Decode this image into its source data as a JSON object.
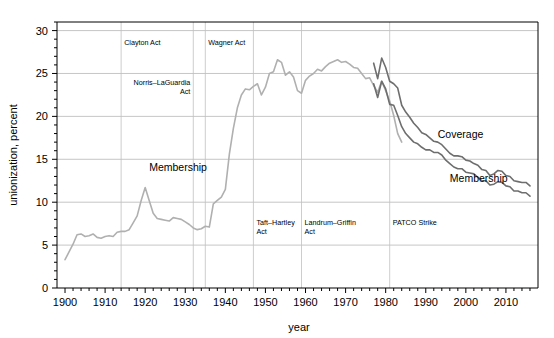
{
  "chart_data": {
    "type": "line",
    "title": "",
    "xlabel": "year",
    "ylabel": "unionization, percent",
    "xlim": [
      1898,
      2018
    ],
    "ylim": [
      0,
      31
    ],
    "x_ticks": [
      1900,
      1910,
      1920,
      1930,
      1940,
      1950,
      1960,
      1970,
      1980,
      1990,
      2000,
      2010
    ],
    "x_tick_labels": [
      "1900",
      "1910",
      "1920",
      "1930",
      "1940",
      "1950",
      "1960",
      "1970",
      "1980",
      "1990",
      "2000",
      "2010"
    ],
    "x_minor_step": 2,
    "y_ticks": [
      0,
      5,
      10,
      15,
      20,
      25,
      30
    ],
    "y_tick_labels": [
      "0",
      "5",
      "10",
      "15",
      "20",
      "25",
      "30"
    ],
    "y_minor_step": 1,
    "grid": "horizontal-major-and-event-verticals",
    "legend_position": "inline-labels",
    "series": [
      {
        "name": "Membership (historical)",
        "color": "#b0b0b0",
        "label_text": "Membership",
        "label_x": 1921,
        "label_y": 13.6,
        "x": [
          1900,
          1901,
          1902,
          1903,
          1904,
          1905,
          1906,
          1907,
          1908,
          1909,
          1910,
          1911,
          1912,
          1913,
          1914,
          1915,
          1916,
          1917,
          1918,
          1919,
          1920,
          1921,
          1922,
          1923,
          1924,
          1925,
          1926,
          1927,
          1928,
          1929,
          1930,
          1931,
          1932,
          1933,
          1934,
          1935,
          1936,
          1937,
          1938,
          1939,
          1940,
          1941,
          1942,
          1943,
          1944,
          1945,
          1946,
          1947,
          1948,
          1949,
          1950,
          1951,
          1952,
          1953,
          1954,
          1955,
          1956,
          1957,
          1958,
          1959,
          1960,
          1961,
          1962,
          1963,
          1964,
          1965,
          1966,
          1967,
          1968,
          1969,
          1970,
          1971,
          1972,
          1973,
          1974,
          1975,
          1976,
          1977,
          1978,
          1979,
          1980,
          1981,
          1982,
          1983,
          1984
        ],
        "y": [
          3.3,
          4.2,
          5.1,
          6.2,
          6.3,
          6.0,
          6.1,
          6.3,
          5.9,
          5.8,
          6.0,
          6.1,
          6.0,
          6.5,
          6.6,
          6.6,
          6.8,
          7.6,
          8.4,
          10.2,
          11.7,
          10.2,
          8.7,
          8.1,
          8.0,
          7.9,
          7.8,
          8.2,
          8.1,
          8.0,
          7.7,
          7.4,
          7.0,
          6.8,
          6.9,
          7.2,
          7.1,
          9.8,
          10.2,
          10.6,
          11.5,
          15.6,
          18.6,
          21.0,
          22.5,
          23.2,
          23.1,
          23.5,
          23.8,
          22.5,
          23.4,
          25.0,
          25.2,
          26.6,
          26.3,
          24.8,
          25.2,
          24.6,
          23.0,
          22.7,
          24.2,
          24.7,
          25.0,
          25.5,
          25.3,
          25.8,
          26.2,
          26.4,
          26.6,
          26.3,
          26.4,
          26.1,
          25.7,
          25.6,
          25.0,
          24.4,
          24.5,
          23.6,
          22.8,
          24.1,
          23.0,
          21.8,
          20.1,
          18.0,
          17.0
        ]
      },
      {
        "name": "Coverage",
        "color": "#6e6e6e",
        "label_text": "Coverage",
        "label_x": 1993,
        "label_y": 17.5,
        "x": [
          1977,
          1978,
          1979,
          1980,
          1981,
          1982,
          1983,
          1984,
          1985,
          1986,
          1987,
          1988,
          1989,
          1990,
          1991,
          1992,
          1993,
          1994,
          1995,
          1996,
          1997,
          1998,
          1999,
          2000,
          2001,
          2002,
          2003,
          2004,
          2005,
          2006,
          2007,
          2008,
          2009,
          2010,
          2011,
          2012,
          2013,
          2014,
          2015,
          2016
        ],
        "y": [
          26.2,
          24.4,
          26.8,
          25.7,
          24.1,
          23.8,
          23.3,
          21.3,
          20.5,
          19.9,
          19.2,
          18.7,
          18.1,
          17.9,
          17.5,
          17.1,
          17.0,
          16.7,
          16.2,
          15.7,
          15.4,
          15.4,
          15.3,
          14.9,
          14.8,
          14.5,
          14.3,
          13.8,
          13.7,
          13.1,
          13.3,
          13.7,
          13.6,
          13.1,
          13.0,
          12.5,
          12.4,
          12.3,
          12.3,
          11.9
        ]
      },
      {
        "name": "Membership",
        "color": "#6e6e6e",
        "label_text": "Membership",
        "label_x": 1996,
        "label_y": 12.4,
        "x": [
          1977,
          1978,
          1979,
          1980,
          1981,
          1982,
          1983,
          1984,
          1985,
          1986,
          1987,
          1988,
          1989,
          1990,
          1991,
          1992,
          1993,
          1994,
          1995,
          1996,
          1997,
          1998,
          1999,
          2000,
          2001,
          2002,
          2003,
          2004,
          2005,
          2006,
          2007,
          2008,
          2009,
          2010,
          2011,
          2012,
          2013,
          2014,
          2015,
          2016
        ],
        "y": [
          23.8,
          22.2,
          24.1,
          23.2,
          21.4,
          21.3,
          20.1,
          18.8,
          18.0,
          17.5,
          17.0,
          16.8,
          16.4,
          16.1,
          16.1,
          15.8,
          15.8,
          15.5,
          14.9,
          14.5,
          14.1,
          13.9,
          13.9,
          13.5,
          13.4,
          13.3,
          12.9,
          12.5,
          12.5,
          12.0,
          12.1,
          12.4,
          12.3,
          11.9,
          11.8,
          11.3,
          11.3,
          11.1,
          11.1,
          10.7
        ]
      }
    ],
    "annotations": [
      {
        "text": "Clayton Act",
        "year": 1914,
        "y_value": 28.3,
        "align": "left",
        "line": true
      },
      {
        "text": "Norris–LaGuardia",
        "text2": "Act",
        "year": 1932,
        "y_value": 23.7,
        "align": "right",
        "line": true
      },
      {
        "text": "Wagner Act",
        "year": 1935,
        "y_value": 28.3,
        "align": "left",
        "line": true
      },
      {
        "text": "Taft–Hartley",
        "text2": "Act",
        "year": 1947,
        "y_value": 7.3,
        "align": "left",
        "line": true
      },
      {
        "text": "Landrum–Griffin",
        "text2": "Act",
        "year": 1959,
        "y_value": 7.3,
        "align": "left",
        "line": true
      },
      {
        "text": "PATCO Strike",
        "year": 1981,
        "y_value": 7.3,
        "align": "left",
        "line": true
      }
    ]
  },
  "colors": {
    "axis": "#000000",
    "grid": "#b8b8b8",
    "event_line": "#c0c0c0",
    "historical_series": "#b0b0b0",
    "modern_series": "#6e6e6e",
    "background": "#ffffff"
  }
}
